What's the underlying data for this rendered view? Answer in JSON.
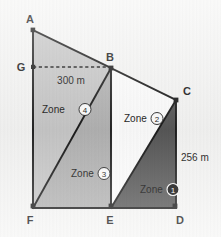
{
  "figure": {
    "background_color": "#f7f7f6",
    "stroke_color": "#1b1b1b"
  },
  "vertices": [
    {
      "id": "A",
      "label": "A",
      "x": 33,
      "y": 30,
      "label_x": 30,
      "label_y": 23
    },
    {
      "id": "B",
      "label": "B",
      "x": 111,
      "y": 68,
      "label_x": 110,
      "label_y": 61
    },
    {
      "id": "C",
      "label": "C",
      "x": 176,
      "y": 100,
      "label_x": 185,
      "label_y": 95
    },
    {
      "id": "D",
      "label": "D",
      "x": 176,
      "y": 208,
      "label_x": 173,
      "label_y": 222
    },
    {
      "id": "E",
      "label": "E",
      "x": 111,
      "y": 208,
      "label_x": 108,
      "label_y": 222
    },
    {
      "id": "F",
      "label": "F",
      "x": 33,
      "y": 208,
      "label_x": 30,
      "label_y": 222
    },
    {
      "id": "G",
      "label": "G",
      "x": 33,
      "y": 67,
      "label_x": 22,
      "label_y": 71
    }
  ],
  "zones": [
    {
      "id": "zone-1",
      "label": "Zone",
      "number": "1",
      "fill": "#585858",
      "badge_style": "filled",
      "label_x": 140,
      "label_y": 190,
      "polygon": "111,208 176,100 176,208"
    },
    {
      "id": "zone-2",
      "label": "Zone",
      "number": "2",
      "fill": "#ffffff",
      "badge_style": "outline",
      "label_x": 124,
      "label_y": 119,
      "polygon": "111,68 176,100 111,208"
    },
    {
      "id": "zone-3",
      "label": "Zone",
      "number": "3",
      "fill": "#b4b4b4",
      "badge_style": "outline",
      "label_x": 71,
      "label_y": 174,
      "polygon": "111,68 111,208 33,208"
    },
    {
      "id": "zone-4",
      "label": "Zone",
      "number": "4",
      "fill": "#c9c9c9",
      "badge_style": "outline",
      "label_x": 42,
      "label_y": 110,
      "polygon": "33,30 111,68 33,208"
    }
  ],
  "dimensions": [
    {
      "id": "gb-width",
      "text": "300 m",
      "x": 48,
      "y": 83,
      "line": {
        "x1": 33,
        "y1": 67,
        "x2": 111,
        "y2": 67,
        "style": "dashed"
      }
    },
    {
      "id": "cd-height",
      "text": "256 m",
      "x": 181,
      "y": 161,
      "line": null
    }
  ],
  "edges": [
    {
      "id": "edge-AB",
      "from": "A",
      "to": "B"
    },
    {
      "id": "edge-BC",
      "from": "B",
      "to": "C"
    },
    {
      "id": "edge-CD",
      "from": "C",
      "to": "D"
    },
    {
      "id": "edge-DF",
      "from": "D",
      "to": "F"
    },
    {
      "id": "edge-FA",
      "from": "F",
      "to": "A"
    },
    {
      "id": "edge-FB",
      "from": "F",
      "to": "B"
    },
    {
      "id": "edge-BE",
      "from": "B",
      "to": "E"
    },
    {
      "id": "edge-EC",
      "from": "E",
      "to": "C"
    }
  ]
}
